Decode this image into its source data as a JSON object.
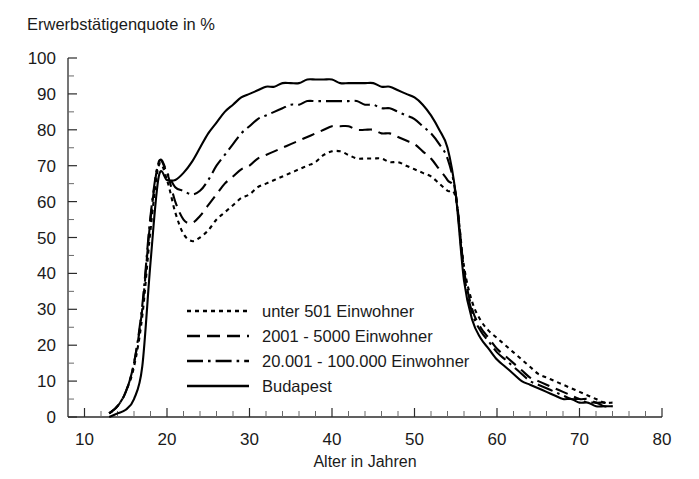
{
  "chart_data": {
    "type": "line",
    "title": "Erwerbstätigenquote in %",
    "xlabel": "Alter in Jahren",
    "ylabel": "",
    "xlim": [
      8,
      80
    ],
    "ylim": [
      0,
      100
    ],
    "grid": false,
    "legend_position": "center-left-inside",
    "x_ticks_major": [
      10,
      20,
      30,
      40,
      50,
      60,
      70,
      80
    ],
    "x_tick_minor_step": 2,
    "y_ticks_major": [
      0,
      10,
      20,
      30,
      40,
      50,
      60,
      70,
      80,
      90,
      100
    ],
    "y_tick_minor_step": 5,
    "x": [
      13,
      14,
      15,
      16,
      17,
      18,
      19,
      20,
      21,
      22,
      23,
      24,
      25,
      26,
      27,
      28,
      29,
      30,
      31,
      32,
      33,
      34,
      35,
      36,
      37,
      38,
      39,
      40,
      41,
      42,
      43,
      44,
      45,
      46,
      47,
      48,
      49,
      50,
      51,
      52,
      53,
      54,
      55,
      56,
      57,
      58,
      59,
      60,
      61,
      62,
      63,
      64,
      65,
      66,
      67,
      68,
      69,
      70,
      71,
      72,
      73,
      74
    ],
    "series": [
      {
        "name": "unter 501 Einwohner",
        "dash": "dotted",
        "values": [
          1,
          3,
          7,
          14,
          28,
          52,
          70,
          66,
          57,
          51,
          49,
          50,
          52,
          55,
          57,
          59,
          61,
          62,
          64,
          65,
          66,
          67,
          68,
          69,
          70,
          71,
          73,
          74,
          74,
          73,
          72,
          72,
          72,
          72,
          71,
          71,
          70,
          69,
          68,
          67,
          65,
          63,
          61,
          42,
          32,
          27,
          24,
          22,
          20,
          18,
          16,
          14,
          12,
          11,
          10,
          9,
          8,
          7,
          6,
          5,
          4,
          4
        ]
      },
      {
        "name": "2001 - 5000 Einwohner",
        "dash": "dashed",
        "values": [
          1,
          3,
          7,
          15,
          30,
          55,
          71,
          68,
          60,
          55,
          54,
          56,
          59,
          62,
          65,
          67,
          69,
          70,
          72,
          73,
          74,
          75,
          76,
          77,
          78,
          79,
          80,
          81,
          81,
          81,
          80,
          80,
          80,
          79,
          79,
          78,
          77,
          76,
          74,
          72,
          69,
          66,
          62,
          41,
          30,
          25,
          22,
          19,
          17,
          15,
          13,
          11,
          10,
          9,
          8,
          7,
          6,
          5,
          5,
          4,
          4,
          3
        ]
      },
      {
        "name": "20.001 - 100.000 Einwohner",
        "dash": "dashdot",
        "values": [
          1,
          3,
          7,
          15,
          31,
          56,
          71,
          68,
          64,
          63,
          62,
          63,
          66,
          70,
          73,
          76,
          79,
          81,
          83,
          84,
          85,
          86,
          87,
          87,
          88,
          88,
          88,
          88,
          88,
          88,
          88,
          87,
          87,
          86,
          86,
          85,
          84,
          83,
          81,
          79,
          76,
          72,
          62,
          40,
          29,
          24,
          21,
          18,
          16,
          14,
          12,
          10,
          9,
          8,
          7,
          6,
          5,
          5,
          4,
          4,
          3,
          3
        ]
      },
      {
        "name": "Budapest",
        "dash": "solid",
        "values": [
          0,
          1,
          2,
          5,
          14,
          43,
          67,
          66,
          66,
          68,
          71,
          75,
          79,
          82,
          85,
          87,
          89,
          90,
          91,
          92,
          92,
          93,
          93,
          93,
          94,
          94,
          94,
          94,
          93,
          93,
          93,
          93,
          93,
          92,
          92,
          91,
          90,
          89,
          87,
          84,
          80,
          75,
          62,
          38,
          27,
          22,
          19,
          16,
          14,
          12,
          10,
          9,
          8,
          7,
          6,
          5,
          5,
          4,
          4,
          3,
          3,
          3
        ]
      }
    ]
  },
  "legend": {
    "items": [
      {
        "label": "unter 501 Einwohner"
      },
      {
        "label": "2001 - 5000 Einwohner"
      },
      {
        "label": "20.001 - 100.000 Einwohner"
      },
      {
        "label": "Budapest"
      }
    ]
  },
  "colors": {
    "ink": "#000000",
    "axis": "#2b2b2b",
    "background": "#ffffff"
  }
}
